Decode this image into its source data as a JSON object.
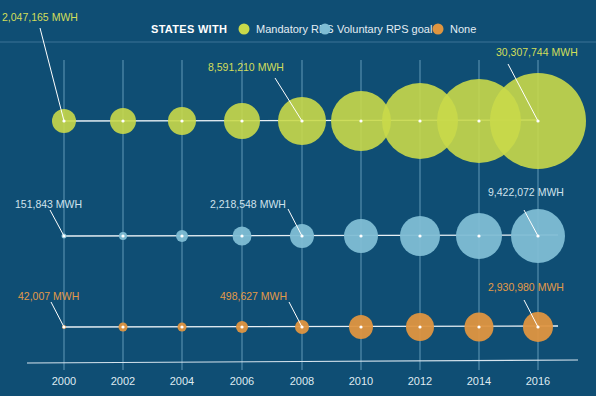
{
  "chart_data": {
    "type": "bubble",
    "title": "",
    "legend": {
      "title": "STATES WITH",
      "position": "top",
      "entries": [
        {
          "name": "Mandatory RPS",
          "color": "#c9d94a"
        },
        {
          "name": "Voluntary RPS goal",
          "color": "#7fbdd4"
        },
        {
          "name": "None",
          "color": "#df9540"
        }
      ]
    },
    "xlabel": "",
    "ylabel": "",
    "unit": "MWH",
    "categories": [
      "2000",
      "2002",
      "2004",
      "2006",
      "2008",
      "2010",
      "2012",
      "2014",
      "2016"
    ],
    "grid": "vertical lines at each year",
    "series": [
      {
        "name": "Mandatory RPS",
        "color": "#c9d94a",
        "values": [
          2047165,
          2300000,
          2700000,
          4500000,
          8591210,
          13000000,
          20000000,
          24000000,
          30307744
        ],
        "radii_px": [
          12,
          13,
          14,
          18,
          24,
          30,
          38,
          42,
          48
        ],
        "labeled_points": [
          {
            "year": "2000",
            "label": "2,047,165 MWH"
          },
          {
            "year": "2008",
            "label": "8,591,210 MWH"
          },
          {
            "year": "2016",
            "label": "30,307,744 MWH"
          }
        ]
      },
      {
        "name": "Voluntary RPS goal",
        "color": "#7fbdd4",
        "values": [
          151843,
          300000,
          600000,
          1500000,
          2218548,
          4500000,
          6000000,
          7500000,
          9422072
        ],
        "radii_px": [
          2.5,
          4,
          6,
          9.5,
          12,
          17,
          20,
          23,
          27
        ],
        "labeled_points": [
          {
            "year": "2000",
            "label": "151,843 MWH"
          },
          {
            "year": "2008",
            "label": "2,218,548 MWH"
          },
          {
            "year": "2016",
            "label": "9,422,072 MWH"
          }
        ]
      },
      {
        "name": "None",
        "color": "#df9540",
        "values": [
          42007,
          170000,
          190000,
          380000,
          498627,
          1500000,
          2200000,
          2200000,
          2930980
        ],
        "radii_px": [
          2,
          4.5,
          4.5,
          6,
          7,
          12,
          14,
          14.5,
          15
        ],
        "labeled_points": [
          {
            "year": "2000",
            "label": "42,007 MWH"
          },
          {
            "year": "2008",
            "label": "498,627 MWH"
          },
          {
            "year": "2016",
            "label": "2,930,980 MWH"
          }
        ]
      }
    ]
  },
  "layout": {
    "background": "#0f4e74",
    "x_positions": [
      64,
      123,
      182,
      242,
      302,
      361,
      420,
      479,
      538
    ],
    "row_y": [
      121,
      236,
      327
    ],
    "annotations": [
      [
        {
          "text": "2,047,165 MWH",
          "tx": 2,
          "ty": 21,
          "lx1": 40,
          "ly1": 28
        },
        {
          "text": "8,591,210 MWH",
          "tx": 208,
          "ty": 71,
          "lx1": 275,
          "ly1": 78
        },
        {
          "text": "30,307,744 MWH",
          "tx": 496,
          "ty": 56,
          "lx1": 508,
          "ly1": 64
        }
      ],
      [
        {
          "text": "151,843 MWH",
          "tx": 15,
          "ty": 208,
          "lx1": 50,
          "ly1": 210
        },
        {
          "text": "2,218,548 MWH",
          "tx": 210,
          "ty": 208,
          "lx1": 288,
          "ly1": 209
        },
        {
          "text": "9,422,072 MWH",
          "tx": 488,
          "ty": 196,
          "lx1": 524,
          "ly1": 210
        }
      ],
      [
        {
          "text": "42,007 MWH",
          "tx": 18,
          "ty": 300,
          "lx1": 51,
          "ly1": 302
        },
        {
          "text": "498,627 MWH",
          "tx": 220,
          "ty": 300,
          "lx1": 289,
          "ly1": 302
        },
        {
          "text": "2,930,980 MWH",
          "tx": 488,
          "ty": 291,
          "lx1": 524,
          "ly1": 300
        }
      ]
    ]
  }
}
